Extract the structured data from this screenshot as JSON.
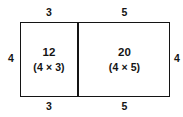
{
  "diagram": {
    "stroke_color": "#141414",
    "background_color": "#ffffff",
    "cells": [
      {
        "name": "left",
        "product": "12",
        "expression": "(4 × 3)",
        "width_label": "3",
        "height_label": "4"
      },
      {
        "name": "right",
        "product": "20",
        "expression": "(4 × 5)",
        "width_label": "5",
        "height_label": "4"
      }
    ],
    "labels": {
      "top_left": "3",
      "top_right": "5",
      "bottom_left": "3",
      "bottom_right": "5",
      "left_side": "4",
      "right_side": "4"
    }
  },
  "chart_data": {
    "type": "bar",
    "xlabel": "",
    "ylabel": "",
    "categories": [
      "(4 × 3)",
      "(4 × 5)"
    ],
    "values": [
      12,
      20
    ],
    "widths": [
      3,
      5
    ],
    "heights": [
      4,
      4
    ],
    "total_area": 32,
    "total_width": 8,
    "grid": false,
    "legend": "none"
  }
}
